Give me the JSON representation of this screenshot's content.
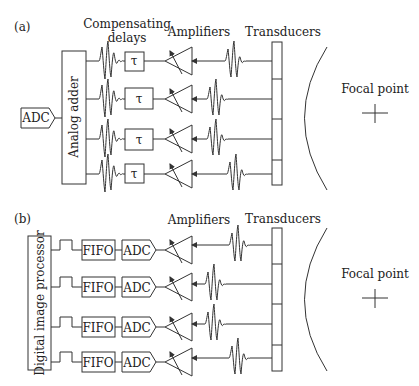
{
  "panel_a": {
    "label": "(a)",
    "comp_delays_line1": "Compensating",
    "comp_delays_line2": "delays",
    "amplifiers": "Amplifiers",
    "transducers": "Transducers",
    "adder": "Analog adder",
    "adc": "ADC",
    "delay_symbol": "τ",
    "focal_point": "Focal point",
    "rows": 4
  },
  "panel_b": {
    "label": "(b)",
    "amplifiers": "Amplifiers",
    "transducers": "Transducers",
    "processor": "Digital image processor",
    "fifo": "FIFO",
    "adc": "ADC",
    "focal_point": "Focal point",
    "rows": 4
  }
}
